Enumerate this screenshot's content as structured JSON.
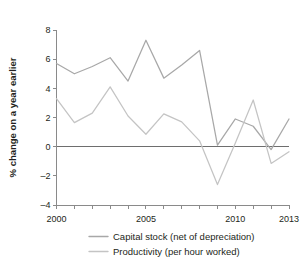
{
  "chart_data": {
    "type": "line",
    "title": "",
    "xlabel": "",
    "ylabel": "% change on a year earlier",
    "x": [
      2000,
      2001,
      2002,
      2003,
      2004,
      2005,
      2006,
      2007,
      2008,
      2009,
      2010,
      2011,
      2012,
      2013
    ],
    "xlim": [
      2000,
      2013
    ],
    "ylim": [
      -4,
      8
    ],
    "yticks": [
      8,
      6,
      4,
      2,
      0,
      -2,
      -4
    ],
    "ytick_labels": [
      "8",
      "6",
      "4",
      "2",
      "0",
      "–2",
      "–4"
    ],
    "xticks": [
      2000,
      2001,
      2002,
      2003,
      2004,
      2005,
      2006,
      2007,
      2008,
      2009,
      2010,
      2011,
      2012,
      2013
    ],
    "xtick_labels_shown": [
      "2000",
      "2005",
      "2010",
      "2013"
    ],
    "xtick_labels_shown_at": [
      2000,
      2005,
      2010,
      2013
    ],
    "grid": false,
    "zero_line": 0,
    "legend_position": "bottom",
    "series": [
      {
        "name": "Capital stock (net of depreciation)",
        "color": "#a8a8a8",
        "values": [
          5.7,
          5.0,
          5.5,
          6.1,
          4.5,
          7.3,
          4.7,
          5.6,
          6.6,
          0.1,
          1.9,
          1.4,
          -0.2,
          1.9
        ]
      },
      {
        "name": "Productivity (per hour worked)",
        "color": "#c4c4c4",
        "values": [
          3.3,
          1.65,
          2.3,
          4.1,
          2.1,
          0.85,
          2.25,
          1.7,
          0.4,
          -2.6,
          0.25,
          3.2,
          -1.15,
          -0.35
        ]
      }
    ]
  },
  "axis": {
    "y_title": "% change on a year earlier"
  },
  "legend": {
    "items": [
      {
        "label": "Capital stock (net of depreciation)"
      },
      {
        "label": "Productivity (per hour worked)"
      }
    ]
  },
  "colors": {
    "axis": "#8a8a8a",
    "zero_line": "#6e6e6e",
    "text": "#231f20",
    "series_capital_stock": "#a8a8a8",
    "series_productivity": "#c4c4c4",
    "background": "#ffffff"
  }
}
